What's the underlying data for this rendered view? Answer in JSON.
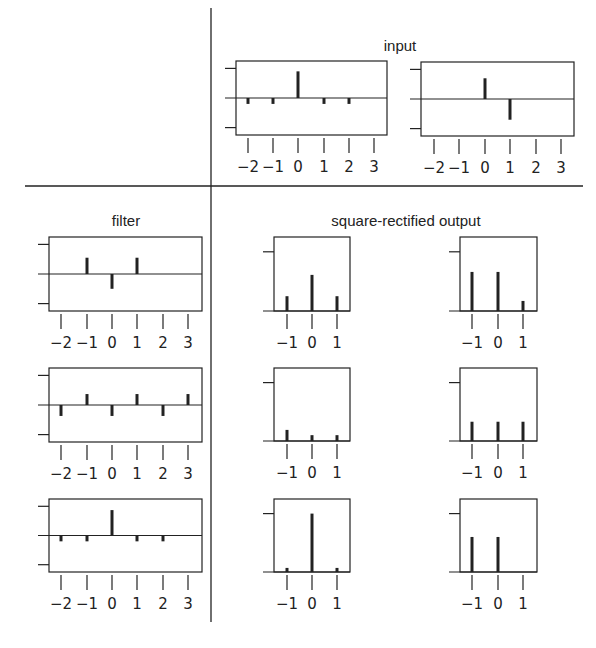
{
  "titles": {
    "input": "input",
    "filter": "filter",
    "output": "square-rectified output"
  },
  "colors": {
    "ink": "#222222",
    "background": "#ffffff"
  },
  "chart_data": [
    {
      "id": "input-1",
      "type": "stem",
      "group": "input",
      "x": [
        -2,
        -1,
        0,
        1,
        2,
        3
      ],
      "values": [
        -0.2,
        -0.2,
        0.9,
        -0.2,
        -0.2,
        0
      ],
      "xticks": [
        "−2",
        "−1",
        "0",
        "1",
        "2",
        "3"
      ],
      "ylim": [
        -1.25,
        1.25
      ],
      "yticks": [
        -1,
        0,
        1
      ]
    },
    {
      "id": "input-2",
      "type": "stem",
      "group": "input",
      "x": [
        -2,
        -1,
        0,
        1,
        2,
        3
      ],
      "values": [
        0,
        0,
        0.7,
        -0.7,
        0,
        0
      ],
      "xticks": [
        "−2",
        "−1",
        "0",
        "1",
        "2",
        "3"
      ],
      "ylim": [
        -1.25,
        1.25
      ],
      "yticks": [
        -1,
        0,
        1
      ]
    },
    {
      "id": "filter-1",
      "type": "stem",
      "group": "filter",
      "x": [
        -2,
        -1,
        0,
        1,
        2,
        3
      ],
      "values": [
        0,
        0.55,
        -0.5,
        0.55,
        0,
        0
      ],
      "xticks": [
        "−2",
        "−1",
        "0",
        "1",
        "2",
        "3"
      ],
      "ylim": [
        -1.25,
        1.25
      ],
      "yticks": [
        -1,
        0,
        1
      ]
    },
    {
      "id": "filter-2",
      "type": "stem",
      "group": "filter",
      "x": [
        -2,
        -1,
        0,
        1,
        2,
        3
      ],
      "values": [
        -0.37,
        0.37,
        -0.37,
        0.37,
        -0.37,
        0.37
      ],
      "xticks": [
        "−2",
        "−1",
        "0",
        "1",
        "2",
        "3"
      ],
      "ylim": [
        -1.25,
        1.25
      ],
      "yticks": [
        -1,
        0,
        1
      ]
    },
    {
      "id": "filter-3",
      "type": "stem",
      "group": "filter",
      "x": [
        -2,
        -1,
        0,
        1,
        2,
        3
      ],
      "values": [
        -0.2,
        -0.2,
        0.87,
        -0.2,
        -0.2,
        0
      ],
      "xticks": [
        "−2",
        "−1",
        "0",
        "1",
        "2",
        "3"
      ],
      "ylim": [
        -1.25,
        1.25
      ],
      "yticks": [
        -1,
        0,
        1
      ]
    },
    {
      "id": "output-1-1",
      "type": "stem",
      "group": "output",
      "x": [
        -1,
        0,
        1
      ],
      "values": [
        0.25,
        0.61,
        0.25
      ],
      "xticks": [
        "−1",
        "0",
        "1"
      ],
      "ylim": [
        0,
        1.25
      ],
      "yticks": [
        0,
        1
      ]
    },
    {
      "id": "output-1-2",
      "type": "stem",
      "group": "output",
      "x": [
        -1,
        0,
        1
      ],
      "values": [
        0.66,
        0.66,
        0.17
      ],
      "xticks": [
        "−1",
        "0",
        "1"
      ],
      "ylim": [
        0,
        1.25
      ],
      "yticks": [
        0,
        1
      ]
    },
    {
      "id": "output-2-1",
      "type": "stem",
      "group": "output",
      "x": [
        -1,
        0,
        1
      ],
      "values": [
        0.19,
        0.1,
        0.1
      ],
      "xticks": [
        "−1",
        "0",
        "1"
      ],
      "ylim": [
        0,
        1.25
      ],
      "yticks": [
        0,
        1
      ]
    },
    {
      "id": "output-2-2",
      "type": "stem",
      "group": "output",
      "x": [
        -1,
        0,
        1
      ],
      "values": [
        0.33,
        0.33,
        0.33
      ],
      "xticks": [
        "−1",
        "0",
        "1"
      ],
      "ylim": [
        0,
        1.25
      ],
      "yticks": [
        0,
        1
      ]
    },
    {
      "id": "output-3-1",
      "type": "stem",
      "group": "output",
      "x": [
        -1,
        0,
        1
      ],
      "values": [
        0.07,
        1.0,
        0.07
      ],
      "xticks": [
        "−1",
        "0",
        "1"
      ],
      "ylim": [
        0,
        1.25
      ],
      "yticks": [
        0,
        1
      ]
    },
    {
      "id": "output-3-2",
      "type": "stem",
      "group": "output",
      "x": [
        -1,
        0,
        1
      ],
      "values": [
        0.6,
        0.6,
        0.0
      ],
      "xticks": [
        "−1",
        "0",
        "1"
      ],
      "ylim": [
        0,
        1.25
      ],
      "yticks": [
        0,
        1
      ]
    }
  ]
}
